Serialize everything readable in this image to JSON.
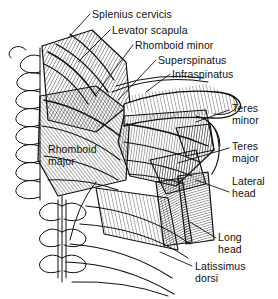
{
  "figure": {
    "name": "posterior-shoulder-muscles",
    "background_color": "#ffffff",
    "ink_color": "#111111",
    "width": 278,
    "height": 299
  },
  "labels": [
    {
      "id": "splenius-cervicis",
      "text": "Splenius cervicis",
      "x": 92,
      "y": 9,
      "leader": [
        [
          90,
          14
        ],
        [
          68,
          38
        ]
      ]
    },
    {
      "id": "levator-scapula",
      "text": "Levator scapula",
      "x": 112,
      "y": 25,
      "leader": [
        [
          110,
          30
        ],
        [
          78,
          62
        ]
      ]
    },
    {
      "id": "rhomboid-minor",
      "text": "Rhomboid minor",
      "x": 135,
      "y": 40,
      "leader": [
        [
          133,
          45
        ],
        [
          96,
          94
        ]
      ]
    },
    {
      "id": "superspinatus",
      "text": "Superspinatus",
      "x": 158,
      "y": 55,
      "leader": [
        [
          156,
          60
        ],
        [
          118,
          100
        ]
      ]
    },
    {
      "id": "infraspinatus",
      "text": "Infraspinatus",
      "x": 172,
      "y": 69,
      "leader": [
        [
          170,
          74
        ],
        [
          146,
          92
        ]
      ]
    },
    {
      "id": "teres-minor",
      "text": "Teres\nminor",
      "x": 232,
      "y": 103,
      "leader": [
        [
          229,
          110
        ],
        [
          196,
          122
        ]
      ]
    },
    {
      "id": "teres-major",
      "text": "Teres\nmajor",
      "x": 232,
      "y": 141,
      "leader": [
        [
          229,
          148
        ],
        [
          178,
          163
        ]
      ]
    },
    {
      "id": "lateral-head",
      "text": "Lateral\nhead",
      "x": 232,
      "y": 176,
      "leader": [
        [
          229,
          192
        ],
        [
          196,
          180
        ]
      ]
    },
    {
      "id": "long-head",
      "text": "Long\nhead",
      "x": 218,
      "y": 232,
      "leader": [
        [
          216,
          238
        ],
        [
          190,
          222
        ]
      ]
    },
    {
      "id": "latissimus-dorsi",
      "text": "Latissimus\ndorsi",
      "x": 195,
      "y": 261,
      "leader": [
        [
          192,
          266
        ],
        [
          160,
          252
        ]
      ]
    },
    {
      "id": "rhomboid-major",
      "text": "Rhomboid\nmajor",
      "x": 48,
      "y": 144,
      "leader": null
    }
  ]
}
